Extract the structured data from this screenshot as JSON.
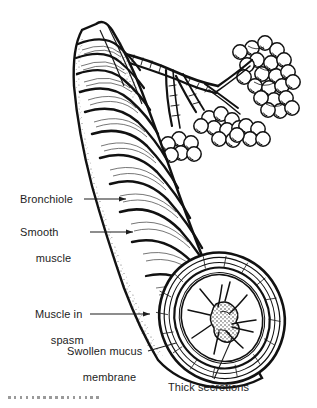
{
  "figure": {
    "style": "black-and-white pen-and-ink medical line drawing",
    "background_color": "#ffffff",
    "ink_color": "#111111",
    "text_color": "#1d1d1d",
    "dot_color": "#9a9a9a",
    "dot_count": 16
  },
  "labels": {
    "bronchiole": "Bronchiole",
    "smooth_muscle_line1": "Smooth",
    "smooth_muscle_line2": "muscle",
    "muscle_spasm_line1": "Muscle in",
    "muscle_spasm_line2": "spasm",
    "swollen_mucus_line1": "Swollen mucus",
    "swollen_mucus_line2": "membrane",
    "thick_secretions": "Thick secretions"
  },
  "parts": [
    {
      "name": "alveoli-cluster",
      "description": "grape-like cluster of alveolar sacs at upper right"
    },
    {
      "name": "bronchiole-tube",
      "description": "large airway running diagonally with spiral muscle banding"
    },
    {
      "name": "smooth-muscle-bands",
      "description": "helical smooth muscle fibers wrapping the airway"
    },
    {
      "name": "cross-section-lumen",
      "description": "open cut end showing narrowed star-shaped lumen"
    },
    {
      "name": "mucus-plug",
      "description": "stippled thick secretions occluding the lumen centre"
    }
  ]
}
